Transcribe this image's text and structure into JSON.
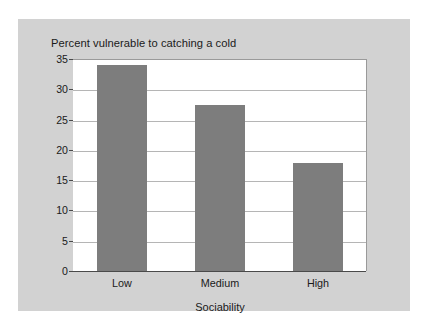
{
  "chart_data": {
    "type": "bar",
    "title": "Percent vulnerable to catching a cold",
    "xlabel": "Sociability",
    "ylabel": "",
    "categories": [
      "Low",
      "Medium",
      "High"
    ],
    "values": [
      34.0,
      27.4,
      17.8
    ],
    "ylim": [
      0,
      35
    ],
    "yticks": [
      0,
      5,
      10,
      15,
      20,
      25,
      30,
      35
    ],
    "ytick_labels": [
      "0",
      "5",
      "10",
      "15",
      "20",
      "25",
      "30",
      "35"
    ],
    "grid": "horizontal",
    "legend": "none",
    "bar_color": "#7d7d7d",
    "plot_background": "#ffffff",
    "panel_background": "#d2d2d2",
    "gridline_color": "#b5b5b5",
    "axis_color": "#4a4a4a",
    "text_color": "#1a1a1a"
  }
}
